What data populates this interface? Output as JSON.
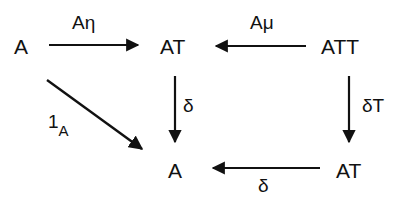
{
  "diagram": {
    "type": "commutative-diagram",
    "nodes": {
      "a_top_left": "A",
      "at_top_mid": "AT",
      "att_top_right": "ATT",
      "a_bottom_mid": "A",
      "at_bottom_right": "AT"
    },
    "labels": {
      "a_eta": "Aη",
      "a_mu": "Aμ",
      "delta_mid": "δ",
      "delta_t": "δT",
      "delta_bottom": "δ",
      "identity_main": "1",
      "identity_sub": "A"
    },
    "edges": [
      {
        "from": "A",
        "to": "AT",
        "label": "Aη"
      },
      {
        "from": "ATT",
        "to": "AT",
        "label": "Aμ"
      },
      {
        "from": "AT",
        "to": "A",
        "label": "δ"
      },
      {
        "from": "ATT",
        "to": "AT",
        "label": "δT"
      },
      {
        "from": "AT",
        "to": "A",
        "label": "δ"
      },
      {
        "from": "A",
        "to": "A",
        "label": "1_A"
      }
    ],
    "colors": {
      "ink": "#111111",
      "background": "#ffffff"
    }
  }
}
